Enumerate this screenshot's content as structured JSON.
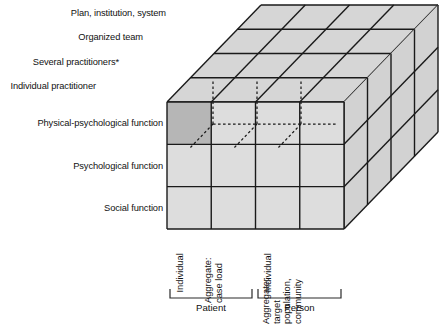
{
  "figure": {
    "title": "",
    "type": "three-dimensional-matrix-cube-diagram",
    "shaded_cell": {
      "row": "Physical-psychological function",
      "column": "Individual (Patient)",
      "color": "#b6b6b6"
    },
    "colors": {
      "cell_light": "#dddddd",
      "cell_dark": "#b6b6b6",
      "top_face": "#d6d6d6",
      "side_face": "#d2d2d2",
      "stroke": "#1a1a1a",
      "background": "#ffffff"
    }
  },
  "depth_axis": {
    "name": "Provider level",
    "labels": [
      "Plan, institution, system",
      "Organized team",
      "Several practitioners*",
      "Individual practitioner"
    ]
  },
  "vertical_axis": {
    "name": "Function",
    "labels": [
      "Physical-psychological function",
      "Psychological function",
      "Social function"
    ]
  },
  "horizontal_axis": {
    "name": "Unit of focus",
    "columns": [
      {
        "lines": [
          "Individual"
        ]
      },
      {
        "lines": [
          "Aggregate:",
          "case load"
        ]
      },
      {
        "lines": [
          "Individual"
        ]
      },
      {
        "lines": [
          "Aggregate:",
          "target",
          "population,",
          "community"
        ]
      }
    ],
    "groups": [
      {
        "label": "Patient",
        "columns": [
          0,
          1
        ]
      },
      {
        "label": "Person",
        "columns": [
          2,
          3
        ]
      }
    ]
  }
}
